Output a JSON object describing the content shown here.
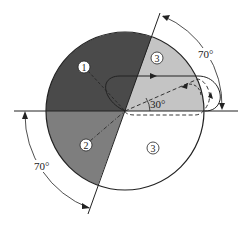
{
  "diagram": {
    "regions": [
      {
        "id": "region-1",
        "label": "1",
        "color": "#4a4a4a"
      },
      {
        "id": "region-2",
        "label": "2",
        "color": "#7e7e7e"
      },
      {
        "id": "region-3-upper",
        "label": "3",
        "color": "#c4c4c4"
      },
      {
        "id": "region-3-lower",
        "label": "3",
        "color": "#ffffff"
      }
    ],
    "angles": {
      "upper_right": "70°",
      "lower_left": "70°",
      "trajectory": "30°"
    }
  }
}
